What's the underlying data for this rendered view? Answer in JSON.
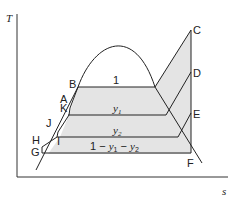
{
  "diagram": {
    "axes": {
      "y_label": "T",
      "x_label": "s"
    },
    "point_labels": {
      "A": "A",
      "B": "B",
      "C": "C",
      "D": "D",
      "E": "E",
      "F": "F",
      "G": "G",
      "H": "H",
      "I": "I",
      "J": "J",
      "K": "K"
    },
    "region_labels": {
      "top": "1",
      "second": "y1",
      "second_base": "y",
      "second_sub": "1",
      "third": "y2",
      "third_base": "y",
      "third_sub": "2",
      "bottom": "1 − y1 − y2",
      "bottom_prefix": "1 − ",
      "bottom_y1_base": "y",
      "bottom_y1_sub": "1",
      "bottom_mid": " − ",
      "bottom_y2_base": "y",
      "bottom_y2_sub": "2"
    },
    "colors": {
      "line": "#222222",
      "fill": "#e4e4e4",
      "background": "#ffffff"
    }
  }
}
